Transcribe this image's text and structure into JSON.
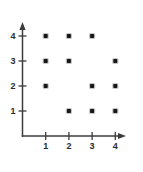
{
  "chart_data": {
    "type": "scatter",
    "title": "",
    "subtitle": "",
    "xlabel": "",
    "ylabel": "",
    "xlim": [
      0,
      4.8
    ],
    "ylim": [
      0,
      4.6
    ],
    "xticks": [
      1,
      2,
      3,
      4
    ],
    "yticks": [
      1,
      2,
      3,
      4
    ],
    "xtick_labels": [
      "1",
      "2",
      "3",
      "4"
    ],
    "ytick_labels": [
      "1",
      "2",
      "3",
      "4"
    ],
    "grid": false,
    "legend": false,
    "legend_position": "none",
    "axis_arrows": true,
    "marker": "filled-square-dot",
    "marker_color": "#171717",
    "axis_color": "#3c3c3c",
    "background_color": "#ffffff",
    "points": [
      {
        "x": 1,
        "y": 4
      },
      {
        "x": 2,
        "y": 4
      },
      {
        "x": 3,
        "y": 4
      },
      {
        "x": 1,
        "y": 3
      },
      {
        "x": 2,
        "y": 3
      },
      {
        "x": 4,
        "y": 3
      },
      {
        "x": 1,
        "y": 2
      },
      {
        "x": 3,
        "y": 2
      },
      {
        "x": 4,
        "y": 2
      },
      {
        "x": 2,
        "y": 1
      },
      {
        "x": 3,
        "y": 1
      },
      {
        "x": 4,
        "y": 1
      }
    ],
    "point_count": 12,
    "missing_points": [
      {
        "x": 4,
        "y": 4
      },
      {
        "x": 3,
        "y": 3
      },
      {
        "x": 2,
        "y": 2
      },
      {
        "x": 1,
        "y": 1
      }
    ],
    "annotations": []
  },
  "axes": {
    "x_axis_name": "x-axis",
    "y_axis_name": "y-axis"
  }
}
